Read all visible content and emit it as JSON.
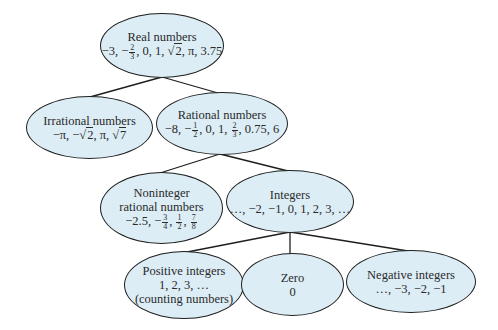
{
  "diagram": {
    "type": "tree",
    "fill_color": "#dcedf5",
    "stroke_color": "#1e1e1e",
    "nodes": {
      "real": {
        "title": "Real numbers",
        "examples_text": "−3, −2/3, 0, 1, √2, π, 3.75",
        "ex": [
          "−3, −",
          "2",
          "3",
          ", 0, 1, ",
          "2",
          ", π, 3.75"
        ]
      },
      "irrational": {
        "title": "Irrational numbers",
        "examples_text": "−π, −√2, π, √7",
        "ex": [
          "−π, −",
          "2",
          ", π, ",
          "7"
        ]
      },
      "rational": {
        "title": "Rational numbers",
        "examples_text": "−8, −1/2, 0, 1, 2/3, 0.75, 6",
        "ex": [
          "−8, −",
          "1",
          "2",
          ", 0, 1, ",
          "2",
          "3",
          ", 0.75, 6"
        ]
      },
      "noninteger": {
        "title_line1": "Noninteger",
        "title_line2": "rational numbers",
        "examples_text": "−2.5, −3/4, 1/2, 7/8",
        "ex": [
          "−2.5, −",
          "3",
          "4",
          ", ",
          "1",
          "2",
          ", ",
          "7",
          "8"
        ]
      },
      "integers": {
        "title": "Integers",
        "examples": "…, −2, −1, 0, 1, 2, 3, …"
      },
      "positive": {
        "title": "Positive integers",
        "examples": "1, 2, 3, …",
        "note": "(counting numbers)"
      },
      "zero": {
        "title": "Zero",
        "examples": "0"
      },
      "negative": {
        "title": "Negative integers",
        "examples": "…, −3, −2, −1"
      }
    },
    "edges": [
      {
        "from": "real",
        "to": "irrational"
      },
      {
        "from": "real",
        "to": "rational"
      },
      {
        "from": "rational",
        "to": "noninteger"
      },
      {
        "from": "rational",
        "to": "integers"
      },
      {
        "from": "integers",
        "to": "positive"
      },
      {
        "from": "integers",
        "to": "zero"
      },
      {
        "from": "integers",
        "to": "negative"
      }
    ]
  }
}
